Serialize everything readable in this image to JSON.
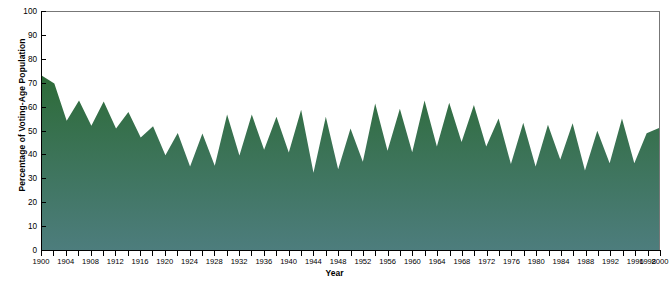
{
  "chart_data": {
    "type": "area",
    "title": "",
    "xlabel": "Year",
    "ylabel": "Percentage of Voting-Age Population",
    "xlim": [
      1900,
      2000
    ],
    "ylim": [
      0,
      100
    ],
    "grid": false,
    "legend": "none",
    "area_color_top": "#2d6b38",
    "area_color_bottom": "#4d7d7d",
    "ytick_labels": [
      "0",
      "10",
      "20",
      "30",
      "40",
      "50",
      "60",
      "70",
      "80",
      "90",
      "100"
    ],
    "ytick_values": [
      0,
      10,
      20,
      30,
      40,
      50,
      60,
      70,
      80,
      90,
      100
    ],
    "xtick_labels": [
      "1900",
      "1904",
      "1908",
      "1912",
      "1916",
      "1920",
      "1924",
      "1928",
      "1932",
      "1936",
      "1940",
      "1944",
      "1948",
      "1952",
      "1956",
      "1960",
      "1964",
      "1968",
      "1972",
      "1976",
      "1980",
      "1984",
      "1988",
      "1992",
      "1996",
      "1998",
      "2000"
    ],
    "xtick_values": [
      1900,
      1904,
      1908,
      1912,
      1916,
      1920,
      1924,
      1928,
      1932,
      1936,
      1940,
      1944,
      1948,
      1952,
      1956,
      1960,
      1964,
      1968,
      1972,
      1976,
      1980,
      1984,
      1988,
      1992,
      1996,
      1998,
      2000
    ],
    "x": [
      1900,
      1902,
      1904,
      1906,
      1908,
      1910,
      1912,
      1914,
      1916,
      1918,
      1920,
      1922,
      1924,
      1926,
      1928,
      1930,
      1932,
      1934,
      1936,
      1938,
      1940,
      1942,
      1944,
      1946,
      1948,
      1950,
      1952,
      1954,
      1956,
      1958,
      1960,
      1962,
      1964,
      1966,
      1968,
      1970,
      1972,
      1974,
      1976,
      1978,
      1980,
      1982,
      1984,
      1986,
      1988,
      1990,
      1992,
      1994,
      1996,
      1998,
      2000
    ],
    "values": [
      73.2,
      70.0,
      54.3,
      62.8,
      52.2,
      62.4,
      51.0,
      58.0,
      47.3,
      52.0,
      39.8,
      49.2,
      35.1,
      48.9,
      35.4,
      56.9,
      39.7,
      56.9,
      42.1,
      56.0,
      41.0,
      58.9,
      32.5,
      56.0,
      33.9,
      51.1,
      37.1,
      61.6,
      41.7,
      59.3,
      41.1,
      62.8,
      43.5,
      61.9,
      45.4,
      60.9,
      43.5,
      55.2,
      36.1,
      53.5,
      35.1,
      52.6,
      38.0,
      53.3,
      33.4,
      50.1,
      36.4,
      55.2,
      36.4,
      49.1,
      51.3
    ]
  }
}
